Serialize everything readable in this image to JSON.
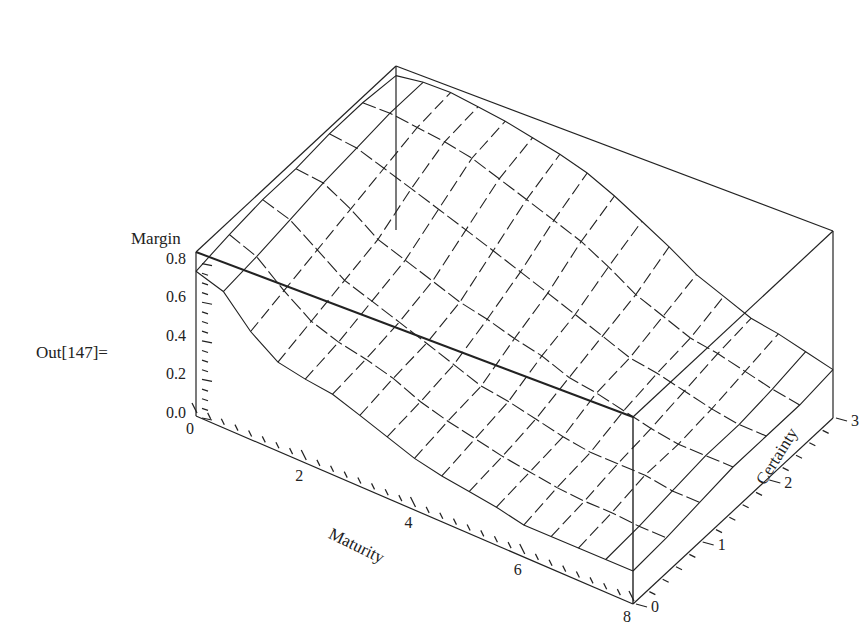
{
  "cell_label": "Out[147]=",
  "chart_data": {
    "type": "surface3d",
    "title": "",
    "xlabel": "Maturity",
    "ylabel": "Certainty",
    "zlabel": "Margin",
    "x_ticks": [
      "0",
      "2",
      "4",
      "6",
      "8"
    ],
    "y_ticks": [
      "0",
      "1",
      "2",
      "3"
    ],
    "z_ticks": [
      "0.0",
      "0.2",
      "0.4",
      "0.6",
      "0.8"
    ],
    "xlim": [
      0,
      8
    ],
    "ylim": [
      0,
      3
    ],
    "zlim": [
      0,
      0.85
    ],
    "boxed": true,
    "mesh": true,
    "x": [
      0,
      0.5,
      1,
      1.5,
      2,
      2.5,
      3,
      3.5,
      4,
      4.5,
      5,
      5.5,
      6,
      6.5,
      7,
      7.5,
      8
    ],
    "y": [
      0,
      0.5,
      1,
      1.5,
      2,
      2.5,
      3
    ],
    "z": [
      [
        0.75,
        0.7,
        0.55,
        0.45,
        0.42,
        0.4,
        0.35,
        0.3,
        0.25,
        0.22,
        0.2,
        0.18,
        0.15,
        0.15,
        0.15,
        0.15,
        0.15
      ],
      [
        0.78,
        0.72,
        0.6,
        0.5,
        0.45,
        0.42,
        0.38,
        0.32,
        0.28,
        0.25,
        0.22,
        0.2,
        0.18,
        0.17,
        0.17,
        0.16,
        0.16
      ],
      [
        0.8,
        0.75,
        0.65,
        0.55,
        0.5,
        0.45,
        0.4,
        0.35,
        0.3,
        0.28,
        0.25,
        0.22,
        0.2,
        0.2,
        0.2,
        0.18,
        0.18
      ],
      [
        0.8,
        0.78,
        0.7,
        0.6,
        0.55,
        0.5,
        0.45,
        0.42,
        0.38,
        0.35,
        0.3,
        0.28,
        0.25,
        0.22,
        0.2,
        0.2,
        0.2
      ],
      [
        0.82,
        0.8,
        0.75,
        0.7,
        0.65,
        0.6,
        0.55,
        0.5,
        0.45,
        0.4,
        0.35,
        0.3,
        0.28,
        0.25,
        0.22,
        0.2,
        0.2
      ],
      [
        0.82,
        0.82,
        0.8,
        0.78,
        0.75,
        0.7,
        0.65,
        0.6,
        0.55,
        0.48,
        0.4,
        0.35,
        0.3,
        0.28,
        0.25,
        0.22,
        0.2
      ],
      [
        0.8,
        0.82,
        0.82,
        0.8,
        0.78,
        0.75,
        0.72,
        0.68,
        0.62,
        0.55,
        0.48,
        0.4,
        0.35,
        0.3,
        0.28,
        0.25,
        0.22
      ]
    ]
  },
  "colors": {
    "line": "#222222",
    "background": "#ffffff"
  }
}
